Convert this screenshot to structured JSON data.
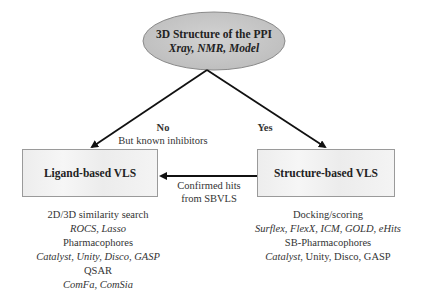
{
  "root": {
    "title": "3D Structure of the PPI",
    "subtitle": "Xray, NMR, Model",
    "fill": "#c8c8c8"
  },
  "branches": {
    "no": {
      "label": "No",
      "sublabel": "But known inhibitors"
    },
    "yes": {
      "label": "Yes"
    }
  },
  "boxes": {
    "ligand": {
      "label": "Ligand-based VLS"
    },
    "structure": {
      "label": "Structure-based VLS"
    }
  },
  "feedback": {
    "line1": "Confirmed hits",
    "line2": "from SBVLS"
  },
  "ligand_methods": [
    {
      "heading": "2D/3D similarity search",
      "tools": "ROCS, Lasso"
    },
    {
      "heading": "Pharmacophores",
      "tools": "Catalyst, Unity, Disco, GASP"
    },
    {
      "heading": "QSAR",
      "tools": "ComFa, ComSia"
    }
  ],
  "structure_methods": [
    {
      "heading": "Docking/scoring",
      "tools": "Surflex, FlexX, ICM, GOLD, eHits"
    },
    {
      "heading": "SB-Pharmacophores",
      "tools_italic": "Catalyst",
      "tools_rest": ", Unity, Disco, GASP"
    }
  ]
}
